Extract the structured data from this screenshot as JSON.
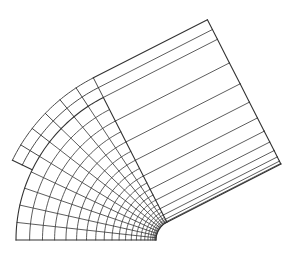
{
  "diagram": {
    "type": "finite-element-mesh",
    "stroke_color": "#333333",
    "background": "#ffffff",
    "bend": {
      "center": [
        176,
        240
      ],
      "inner_radius": 20,
      "outer_radius": 160,
      "angle_start_deg": 180,
      "angle_end_deg": 117,
      "radial_divisions": 22,
      "angular_divisions": 10,
      "grading": 2.2
    },
    "notch": {
      "outer_radius": 182,
      "angle_start_deg": 154,
      "angle_end_deg": 117,
      "radial_divisions": 2
    },
    "straight_leg": {
      "length": 128,
      "direction_deg": 27,
      "divisions_along": 1,
      "cross_divisions": 10
    }
  }
}
